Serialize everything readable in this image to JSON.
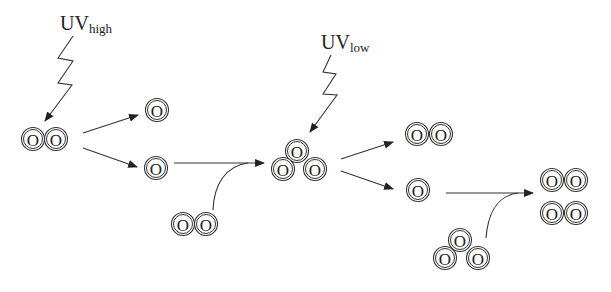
{
  "diagram": {
    "atom_symbol": "O",
    "uv_high": {
      "main": "UV",
      "sub": "high"
    },
    "uv_low": {
      "main": "UV",
      "sub": "low"
    },
    "colors": {
      "stroke": "#333333",
      "text": "#222222",
      "background": "#ffffff"
    },
    "species": [
      {
        "id": "o2-reactant-1",
        "formula": "O2",
        "atoms": 2
      },
      {
        "id": "o-product-upper",
        "formula": "O",
        "atoms": 1
      },
      {
        "id": "o-product-lower",
        "formula": "O",
        "atoms": 1
      },
      {
        "id": "o2-reactant-2",
        "formula": "O2",
        "atoms": 2
      },
      {
        "id": "o3-center",
        "formula": "O3",
        "atoms": 3
      },
      {
        "id": "o2-product-upper",
        "formula": "O2",
        "atoms": 2
      },
      {
        "id": "o-product-right",
        "formula": "O",
        "atoms": 1
      },
      {
        "id": "o3-reactant",
        "formula": "O3",
        "atoms": 3
      },
      {
        "id": "o2-final-1",
        "formula": "O2",
        "atoms": 2
      },
      {
        "id": "o2-final-2",
        "formula": "O2",
        "atoms": 2
      }
    ]
  }
}
